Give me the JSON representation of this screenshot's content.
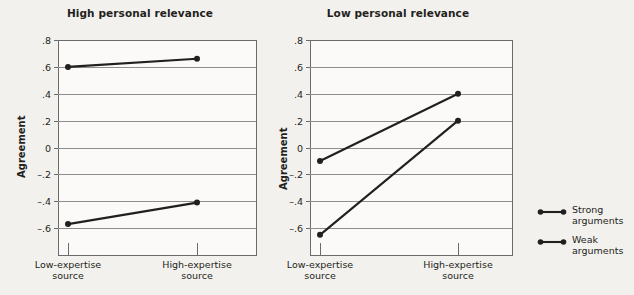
{
  "chart_data": [
    {
      "type": "line",
      "title": "High personal relevance",
      "xlabel": "",
      "ylabel": "Agreement",
      "categories": [
        "Low-expertise\nsource",
        "High-expertise\nsource"
      ],
      "category_labels": [
        {
          "line1": "Low-expertise",
          "line2": "source"
        },
        {
          "line1": "High-expertise",
          "line2": "source"
        }
      ],
      "ylim": [
        -0.8,
        0.8
      ],
      "yticks": [
        0.8,
        0.6,
        0.4,
        0.2,
        0,
        -0.2,
        -0.4,
        -0.6
      ],
      "ytick_labels": [
        ".8",
        ".6",
        ".4",
        ".2",
        "0",
        "–.2",
        "–.4",
        "–.6"
      ],
      "grid": true,
      "series": [
        {
          "name": "Strong arguments",
          "values": [
            0.6,
            0.66
          ]
        },
        {
          "name": "Weak arguments",
          "values": [
            -0.57,
            -0.41
          ]
        }
      ]
    },
    {
      "type": "line",
      "title": "Low personal relevance",
      "xlabel": "",
      "ylabel": "Agreement",
      "categories": [
        "Low-expertise\nsource",
        "High-expertise\nsource"
      ],
      "category_labels": [
        {
          "line1": "Low-expertise",
          "line2": "source"
        },
        {
          "line1": "High-expertise",
          "line2": "source"
        }
      ],
      "ylim": [
        -0.8,
        0.8
      ],
      "yticks": [
        0.8,
        0.6,
        0.4,
        0.2,
        0,
        -0.2,
        -0.4,
        -0.6
      ],
      "ytick_labels": [
        ".8",
        ".6",
        ".4",
        ".2",
        "0",
        "–.2",
        "–.4",
        "–.6"
      ],
      "grid": true,
      "series": [
        {
          "name": "Strong arguments",
          "values": [
            -0.1,
            0.4
          ]
        },
        {
          "name": "Weak arguments",
          "values": [
            -0.65,
            0.2
          ]
        }
      ]
    }
  ],
  "legend": {
    "position": "right",
    "entries": [
      {
        "line1": "Strong",
        "line2": "arguments"
      },
      {
        "line1": "Weak",
        "line2": "arguments"
      }
    ]
  },
  "colors": {
    "background": "#f3f1ee",
    "plot_background": "#fbfaf8",
    "series": "#231f20",
    "grid": "#8d8d8d",
    "frame": "#6b6b6b",
    "text": "#231f20"
  }
}
